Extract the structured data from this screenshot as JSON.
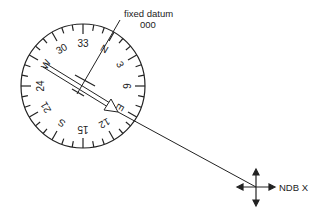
{
  "diagram": {
    "colors": {
      "ink": "#222222",
      "background": "#ffffff"
    },
    "compass": {
      "center": [
        83,
        86
      ],
      "radius": 62,
      "card_rotation_deg": 30,
      "labels": [
        {
          "text": "N",
          "bearing": 0
        },
        {
          "text": "3",
          "bearing": 30
        },
        {
          "text": "6",
          "bearing": 60
        },
        {
          "text": "E",
          "bearing": 90
        },
        {
          "text": "12",
          "bearing": 120
        },
        {
          "text": "15",
          "bearing": 150
        },
        {
          "text": "S",
          "bearing": 180
        },
        {
          "text": "21",
          "bearing": 210
        },
        {
          "text": "24",
          "bearing": 240
        },
        {
          "text": "W",
          "bearing": 270
        },
        {
          "text": "30",
          "bearing": 300
        },
        {
          "text": "33",
          "bearing": 330
        }
      ]
    },
    "datum": {
      "label": "fixed datum",
      "value": "000"
    },
    "ndb": {
      "label": "NDB X",
      "position": [
        256,
        187
      ]
    }
  }
}
